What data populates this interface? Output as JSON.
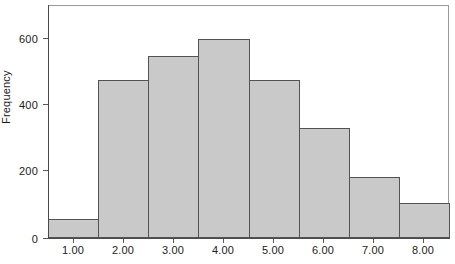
{
  "chart_data": {
    "type": "bar",
    "title": "",
    "subtitle": "",
    "xlabel": "",
    "ylabel": "Frequency",
    "categories": [
      "1.00",
      "2.00",
      "3.00",
      "4.00",
      "5.00",
      "6.00",
      "7.00",
      "8.00"
    ],
    "values": [
      58,
      480,
      552,
      605,
      480,
      335,
      185,
      106
    ],
    "x_tick_labels": [
      "1.00",
      "2.00",
      "3.00",
      "4.00",
      "5.00",
      "6.00",
      "7.00",
      "8.00"
    ],
    "y_tick_labels": [
      "0",
      "200",
      "400",
      "600"
    ],
    "y_ticks": [
      0,
      200,
      400,
      600
    ],
    "ylim": [
      0,
      707
    ],
    "xlim": [
      0.5,
      8.5
    ],
    "grid": false,
    "legend": null,
    "bar_fill_color": "#c9c9c9",
    "bar_edge_color": "#535353",
    "axis_color": "#4a4a4a",
    "frame_color": "#9a9a9a",
    "background_color": "#ffffff",
    "bar_width": 1.0,
    "annotations": []
  },
  "axes": {
    "y_title": "Frequency"
  },
  "footer": {
    "clipped_caption": "............"
  }
}
